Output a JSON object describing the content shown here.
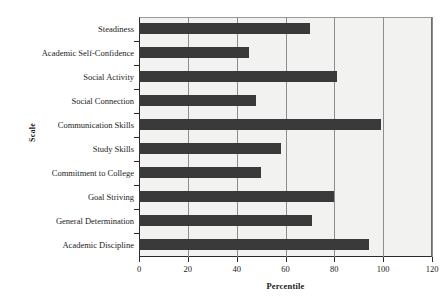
{
  "chart_data": {
    "type": "bar",
    "orientation": "horizontal",
    "title": "",
    "xlabel": "Percentile",
    "ylabel": "Scale",
    "xlim": [
      0,
      120
    ],
    "ylim": null,
    "grid": "vertical",
    "legend": "none",
    "xticks": [
      "0",
      "20",
      "40",
      "60",
      "80",
      "100",
      "120"
    ],
    "xtick_values": [
      0,
      20,
      40,
      60,
      80,
      100,
      120
    ],
    "categories": [
      "Steadiness",
      "Academic Self-Confidence",
      "Social Activity",
      "Social Connection",
      "Communication Skills",
      "Study Skills",
      "Commitment to College",
      "Goal Striving",
      "General Determination",
      "Academic Discipline"
    ],
    "values": [
      70,
      45,
      81,
      48,
      99,
      58,
      50,
      80,
      71,
      94
    ],
    "series": [
      {
        "name": "Percentile",
        "values": [
          70,
          45,
          81,
          48,
          99,
          58,
          50,
          80,
          71,
          94
        ]
      }
    ],
    "colors": {
      "bar": "#3a3a3a",
      "plot_background": "#f2f2f0",
      "gridline": "#8d8d8d",
      "axis": "#2b2b2b",
      "text": "#1c1c1c",
      "page_background": "#ffffff"
    }
  }
}
